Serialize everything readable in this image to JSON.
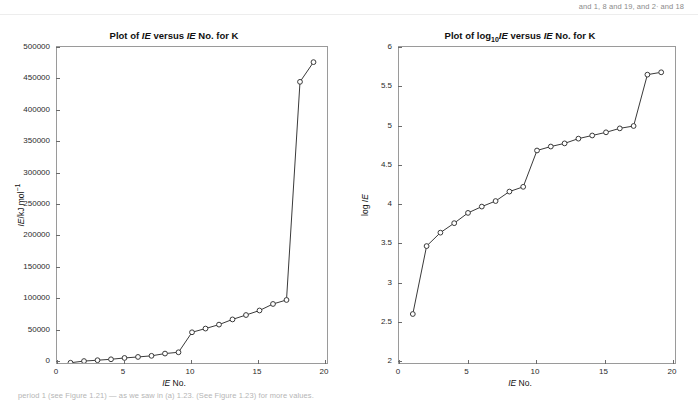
{
  "page": {
    "top_note": "and 1, 8 and 19, and 2∙ and 18",
    "bottom_note": "period 1 (see Figure 1.21) — as we saw in (a) 1.23. (See Figure 1.23) for more values."
  },
  "charts": [
    {
      "title_pre": "Plot of ",
      "title_it1": "IE",
      "title_mid": " versus ",
      "title_it2": "IE",
      "title_post": " No. for K",
      "xlabel_it": "IE",
      "xlabel_post": " No.",
      "ylabel_it": "IE",
      "ylabel_post": "/kJ mol",
      "ylabel_sup": "−1",
      "xticks": [
        0,
        5,
        10,
        15,
        20
      ],
      "yticks": [
        0,
        50000,
        100000,
        150000,
        200000,
        250000,
        300000,
        350000,
        400000,
        450000,
        500000
      ],
      "xlim": [
        0,
        20
      ],
      "ylim": [
        0,
        500000
      ]
    },
    {
      "title_pre": "Plot of log",
      "title_sub": "10",
      "title_it1": "IE",
      "title_mid": " versus ",
      "title_it2": "IE",
      "title_post": " No. for K",
      "xlabel_it": "IE",
      "xlabel_post": " No.",
      "ylabel_pre": "log ",
      "ylabel_it": "IE",
      "xticks": [
        0,
        5,
        10,
        15,
        20
      ],
      "yticks": [
        2,
        2.5,
        3,
        3.5,
        4,
        4.5,
        5,
        5.5,
        6
      ],
      "xlim": [
        0,
        20
      ],
      "ylim": [
        2,
        6
      ]
    }
  ],
  "chart_data": [
    {
      "type": "line",
      "title": "Plot of IE versus IE No. for K",
      "xlabel": "IE No.",
      "ylabel": "IE/kJ mol−1",
      "xlim": [
        0,
        20
      ],
      "ylim": [
        0,
        500000
      ],
      "grid": false,
      "legend": "none",
      "markers": "open-circle",
      "x": [
        1,
        2,
        3,
        4,
        5,
        6,
        7,
        8,
        9,
        10,
        11,
        12,
        13,
        14,
        15,
        16,
        17,
        18,
        19
      ],
      "values": [
        419,
        3052,
        4420,
        5877,
        7975,
        9590,
        11343,
        14944,
        16964,
        48610,
        54490,
        60730,
        68950,
        75900,
        83080,
        93400,
        99710,
        444880,
        476063
      ]
    },
    {
      "type": "line",
      "title": "Plot of log10 IE versus IE No. for K",
      "xlabel": "IE No.",
      "ylabel": "log IE",
      "xlim": [
        0,
        20
      ],
      "ylim": [
        2,
        6
      ],
      "grid": false,
      "legend": "none",
      "markers": "open-circle",
      "x": [
        1,
        2,
        3,
        4,
        5,
        6,
        7,
        8,
        9,
        10,
        11,
        12,
        13,
        14,
        15,
        16,
        17,
        18,
        19
      ],
      "values": [
        2.62,
        3.48,
        3.65,
        3.77,
        3.9,
        3.98,
        4.05,
        4.17,
        4.23,
        4.69,
        4.74,
        4.78,
        4.84,
        4.88,
        4.92,
        4.97,
        5.0,
        5.65,
        5.68
      ]
    }
  ]
}
